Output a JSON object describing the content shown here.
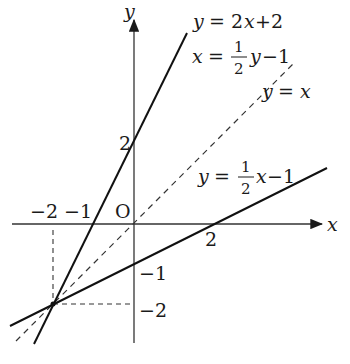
{
  "axes": {
    "x_label": "x",
    "y_label": "y",
    "origin_label": "O",
    "x_ticks": [
      {
        "value": -2,
        "label": "−2"
      },
      {
        "value": -1,
        "label": "−1"
      },
      {
        "value": 2,
        "label": "2"
      }
    ],
    "y_ticks": [
      {
        "value": 2,
        "label": "2"
      },
      {
        "value": -1,
        "label": "−1"
      },
      {
        "value": -2,
        "label": "−2"
      }
    ]
  },
  "lines": [
    {
      "name": "steep-line",
      "equation": "y = 2x+2",
      "alt_equation": "x = ½y−1",
      "style": "solid"
    },
    {
      "name": "identity-line",
      "equation": "y = x",
      "style": "dashed"
    },
    {
      "name": "shallow-line",
      "equation": "y = ½x−1",
      "style": "solid"
    }
  ],
  "labels": {
    "line1_y": "y",
    "line1_eq": "= 2",
    "line1_x": "x",
    "line1_tail": "+2",
    "line2_x": "x",
    "line2_eq": "=",
    "line2_num": "1",
    "line2_den": "2",
    "line2_y": "y",
    "line2_tail": "−1",
    "line3_y": "y",
    "line3_eq": "=",
    "line3_x": "x",
    "line4_y": "y",
    "line4_eq": "=",
    "line4_num": "1",
    "line4_den": "2",
    "line4_x": "x",
    "line4_tail": "−1"
  },
  "intersection": {
    "x": -2,
    "y": -2
  }
}
